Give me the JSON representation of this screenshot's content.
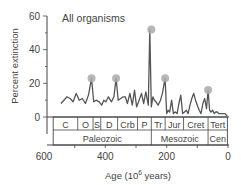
{
  "chart_data": {
    "type": "line",
    "title": "All organisms",
    "xlabel": "Age (10^6 years)",
    "xlabel_main": "Age (10",
    "xlabel_sup": "6",
    "xlabel_tail": " years)",
    "ylabel": "Percent extinction",
    "xlim": [
      600,
      0
    ],
    "ylim": [
      0,
      60
    ],
    "x_ticks": [
      600,
      400,
      200,
      0
    ],
    "x_tick_labels": [
      "600",
      "400",
      "200",
      "0"
    ],
    "y_ticks": [
      0,
      20,
      40,
      60
    ],
    "y_tick_labels": [
      "0",
      "20",
      "40",
      "60"
    ],
    "grid": false,
    "series": [
      {
        "name": "All organisms",
        "color": "#555555",
        "x": [
          545,
          535,
          525,
          515,
          505,
          495,
          485,
          475,
          465,
          455,
          445,
          438,
          430,
          420,
          412,
          405,
          398,
          390,
          380,
          372,
          365,
          358,
          350,
          342,
          335,
          328,
          320,
          312,
          305,
          298,
          290,
          282,
          275,
          268,
          260,
          255,
          250,
          245,
          240,
          235,
          228,
          220,
          214,
          205,
          200,
          195,
          190,
          184,
          178,
          172,
          166,
          160,
          154,
          148,
          142,
          136,
          130,
          124,
          118,
          112,
          106,
          100,
          94,
          88,
          82,
          76,
          70,
          65,
          60,
          55,
          50,
          45,
          40,
          35,
          30,
          25,
          20,
          15,
          10,
          5,
          2
        ],
        "y": [
          8,
          10,
          12,
          11,
          9,
          14,
          10,
          11,
          8,
          13,
          23,
          9,
          10,
          9,
          7,
          10,
          9,
          12,
          9,
          12,
          23,
          10,
          11,
          12,
          12,
          8,
          14,
          7,
          16,
          6,
          10,
          14,
          8,
          15,
          7,
          52,
          6,
          12,
          10,
          9,
          7,
          10,
          14,
          23,
          2,
          4,
          3,
          10,
          2,
          3,
          2,
          8,
          13,
          2,
          3,
          4,
          2,
          7,
          11,
          14,
          10,
          7,
          4,
          2,
          8,
          11,
          5,
          16,
          4,
          3,
          4,
          2,
          3,
          3,
          2,
          2,
          2,
          2,
          2,
          1,
          1
        ]
      }
    ],
    "highlighted_peaks": [
      {
        "x": 445,
        "y": 23
      },
      {
        "x": 365,
        "y": 23
      },
      {
        "x": 250,
        "y": 52
      },
      {
        "x": 205,
        "y": 23
      },
      {
        "x": 65,
        "y": 16
      }
    ],
    "periods": [
      {
        "label": "C",
        "start": 570,
        "end": 490
      },
      {
        "label": "O",
        "start": 490,
        "end": 440
      },
      {
        "label": "S",
        "start": 440,
        "end": 415
      },
      {
        "label": "D",
        "start": 415,
        "end": 360
      },
      {
        "label": "Crb",
        "start": 360,
        "end": 295
      },
      {
        "label": "P",
        "start": 295,
        "end": 250
      },
      {
        "label": "Tr",
        "start": 250,
        "end": 205
      },
      {
        "label": "Jur",
        "start": 205,
        "end": 145
      },
      {
        "label": "Cret",
        "start": 145,
        "end": 65
      },
      {
        "label": "Tert",
        "start": 65,
        "end": 2
      }
    ],
    "eras": [
      {
        "label": "Paleozoic",
        "start": 570,
        "end": 250
      },
      {
        "label": "Mesozoic",
        "start": 250,
        "end": 65
      },
      {
        "label": "Cen",
        "start": 65,
        "end": 2
      }
    ],
    "colors": {
      "line": "#555555",
      "peak_marker": "#aaaaaa",
      "axis": "#444444"
    }
  }
}
